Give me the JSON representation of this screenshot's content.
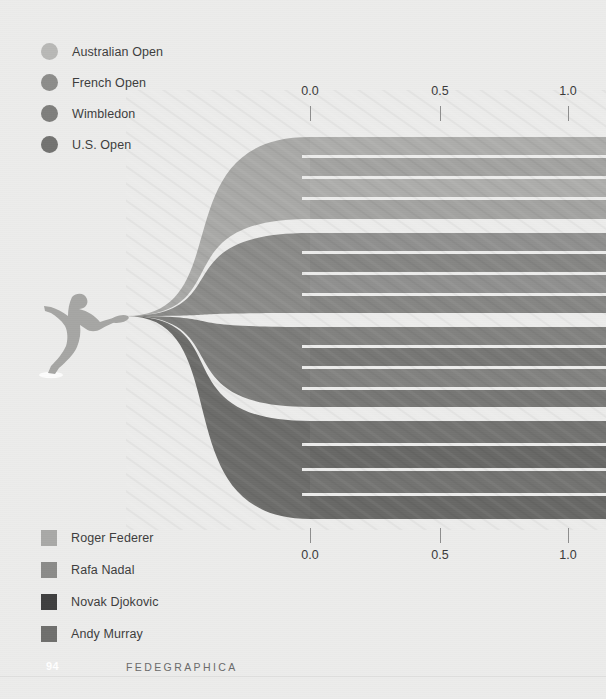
{
  "page": {
    "background_color": "#ececeb",
    "page_number": "94",
    "book_title": "FEDEGRAPHICA"
  },
  "tournament_legend": {
    "name": "tournament-legend",
    "items": [
      {
        "label": "Australian Open",
        "color": "#b8b8b6",
        "icon": "circle-swatch"
      },
      {
        "label": "French Open",
        "color": "#8d8d8b",
        "icon": "circle-swatch"
      },
      {
        "label": "Wimbledon",
        "color": "#7e7e7c",
        "icon": "circle-swatch"
      },
      {
        "label": "U.S. Open",
        "color": "#737371",
        "icon": "circle-swatch"
      }
    ]
  },
  "player_legend": {
    "name": "player-legend",
    "items": [
      {
        "label": "Roger Federer",
        "color": "#a9a9a7",
        "icon": "square-swatch"
      },
      {
        "label": "Rafa Nadal",
        "color": "#8b8b89",
        "icon": "square-swatch"
      },
      {
        "label": "Novak Djokovic",
        "color": "#3f3f3f",
        "icon": "square-swatch"
      },
      {
        "label": "Andy Murray",
        "color": "#6f6f6d",
        "icon": "square-swatch"
      }
    ]
  },
  "axis_top": {
    "name": "axis-top",
    "ticks": [
      {
        "label": "0.0",
        "x": 310
      },
      {
        "label": "0.5",
        "x": 440
      },
      {
        "label": "1.0",
        "x": 568
      }
    ]
  },
  "axis_bottom": {
    "name": "axis-bottom",
    "ticks": [
      {
        "label": "0.0",
        "x": 310
      },
      {
        "label": "0.5",
        "x": 440
      },
      {
        "label": "1.0",
        "x": 568
      }
    ]
  },
  "silhouette": {
    "name": "tennis-player-silhouette",
    "color": "#a6a6a4"
  },
  "chart_data": {
    "type": "area",
    "title": "",
    "subtitle": "",
    "xlabel": "",
    "ylabel": "",
    "xlim": [
      0.0,
      1.0
    ],
    "grid": false,
    "legend_position": "top-left and bottom-left",
    "axis_tick_values": [
      0.0,
      0.5,
      1.0
    ],
    "convergence_point": {
      "x": 126,
      "y": 316
    },
    "fan_start_x": 310,
    "fan_end_x": 606,
    "series": [
      {
        "name": "Roger Federer",
        "color": "#a9a9a7",
        "y_top": 137,
        "y_bottom": 219,
        "sub_bands": [
          {
            "name": "Australian Open",
            "value": 1.0,
            "y_top": 137,
            "y_bottom": 155
          },
          {
            "name": "French Open",
            "value": 1.0,
            "y_top": 158,
            "y_bottom": 176
          },
          {
            "name": "Wimbledon",
            "value": 1.0,
            "y_top": 179,
            "y_bottom": 197
          },
          {
            "name": "U.S. Open",
            "value": 1.0,
            "y_top": 200,
            "y_bottom": 219
          }
        ]
      },
      {
        "name": "Rafa Nadal",
        "color": "#8b8b89",
        "y_top": 233,
        "y_bottom": 313,
        "sub_bands": [
          {
            "name": "Australian Open",
            "value": 1.0,
            "y_top": 233,
            "y_bottom": 251
          },
          {
            "name": "French Open",
            "value": 1.0,
            "y_top": 254,
            "y_bottom": 272
          },
          {
            "name": "Wimbledon",
            "value": 1.0,
            "y_top": 275,
            "y_bottom": 293
          },
          {
            "name": "U.S. Open",
            "value": 1.0,
            "y_top": 296,
            "y_bottom": 313
          }
        ]
      },
      {
        "name": "Novak Djokovic",
        "color": "#7c7c7a",
        "y_top": 327,
        "y_bottom": 407,
        "sub_bands": [
          {
            "name": "Australian Open",
            "value": 1.0,
            "y_top": 327,
            "y_bottom": 345
          },
          {
            "name": "French Open",
            "value": 1.0,
            "y_top": 348,
            "y_bottom": 366
          },
          {
            "name": "Wimbledon",
            "value": 1.0,
            "y_top": 369,
            "y_bottom": 387
          },
          {
            "name": "U.S. Open",
            "value": 1.0,
            "y_top": 390,
            "y_bottom": 407
          }
        ]
      },
      {
        "name": "Andy Murray",
        "color": "#6c6c6a",
        "y_top": 421,
        "y_bottom": 519,
        "sub_bands": [
          {
            "name": "Australian Open",
            "value": 1.0,
            "y_top": 421,
            "y_bottom": 443
          },
          {
            "name": "French Open",
            "value": 1.0,
            "y_top": 446,
            "y_bottom": 468
          },
          {
            "name": "Wimbledon",
            "value": 1.0,
            "y_top": 471,
            "y_bottom": 493
          },
          {
            "name": "U.S. Open",
            "value": 1.0,
            "y_top": 496,
            "y_bottom": 519
          }
        ]
      }
    ]
  }
}
